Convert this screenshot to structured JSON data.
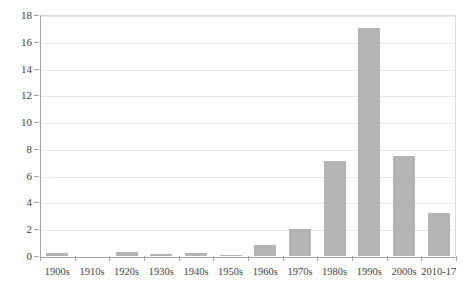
{
  "chart_data": {
    "type": "bar",
    "title": "",
    "subtitle": "",
    "xlabel": "",
    "ylabel": "",
    "categories": [
      "1900s",
      "1910s",
      "1920s",
      "1930s",
      "1940s",
      "1950s",
      "1960s",
      "1970s",
      "1980s",
      "1990s",
      "2000s",
      "2010-17"
    ],
    "values": [
      0.25,
      0.0,
      0.3,
      0.15,
      0.25,
      0.1,
      0.8,
      2.0,
      7.1,
      17.0,
      7.5,
      3.2
    ],
    "series": [
      {
        "name": "",
        "values": [
          0.25,
          0.0,
          0.3,
          0.15,
          0.25,
          0.1,
          0.8,
          2.0,
          7.1,
          17.0,
          7.5,
          3.2
        ]
      }
    ],
    "ylim": [
      0,
      18
    ],
    "ytick_step": 2,
    "ytick_labels": [
      "0",
      "2",
      "4",
      "6",
      "8",
      "10",
      "12",
      "14",
      "16",
      "18"
    ],
    "ytick_values": [
      0,
      2,
      4,
      6,
      8,
      10,
      12,
      14,
      16,
      18
    ],
    "grid": true,
    "grid_axis": "y",
    "legend": false,
    "legend_position": "none",
    "annotations": [],
    "colors": {
      "bar": "#b4b4b4",
      "gridline": "#e8e8e8",
      "axis": "#a6a6a6",
      "text": "#3f3f3f",
      "background": "#ffffff"
    }
  }
}
